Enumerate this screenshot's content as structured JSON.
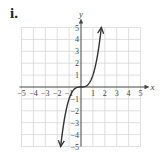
{
  "figure": {
    "label": "i."
  },
  "chart_data": {
    "type": "line",
    "title": "",
    "xlabel": "x",
    "ylabel": "y",
    "xlim": [
      -5,
      5
    ],
    "ylim": [
      -5,
      5
    ],
    "grid": true,
    "x_ticks": [
      "-5",
      "-4",
      "-3",
      "-2",
      "-1",
      "1",
      "2",
      "3",
      "4",
      "5"
    ],
    "y_ticks": [
      "5",
      "4",
      "3",
      "2",
      "1",
      "-1",
      "-2",
      "-3",
      "-4",
      "-5"
    ],
    "series": [
      {
        "name": "y = x^3",
        "x": [
          -1.71,
          -1.5,
          -1.25,
          -1,
          -0.75,
          -0.5,
          -0.25,
          0,
          0.25,
          0.5,
          0.75,
          1,
          1.25,
          1.5,
          1.71
        ],
        "y": [
          -5,
          -3.375,
          -1.953,
          -1,
          -0.422,
          -0.125,
          -0.016,
          0,
          0.016,
          0.125,
          0.422,
          1,
          1.953,
          3.375,
          5
        ],
        "arrows": "both"
      }
    ],
    "colors": {
      "grid": "#d8d8d8",
      "axis": "#444444",
      "curve": "#333333",
      "text": "#444444"
    }
  }
}
